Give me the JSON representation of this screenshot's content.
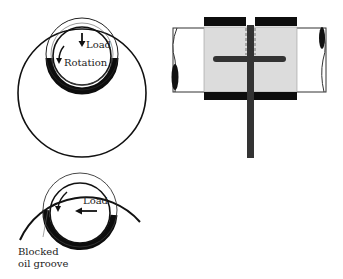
{
  "figures": {
    "top_left": {
      "labels": {
        "load": "Load",
        "rotation": "Rotation"
      }
    },
    "top_right": {
      "description": "shaft through split bearing with oil groove and feed"
    },
    "bottom_left": {
      "labels": {
        "load": "Load",
        "blocked_line1": "Blocked",
        "blocked_line2": "oil groove"
      }
    }
  },
  "colors": {
    "ink": "#111111",
    "shade": "#dcdcdc",
    "bearing": "#0d0d0d",
    "groove": "#333333"
  }
}
